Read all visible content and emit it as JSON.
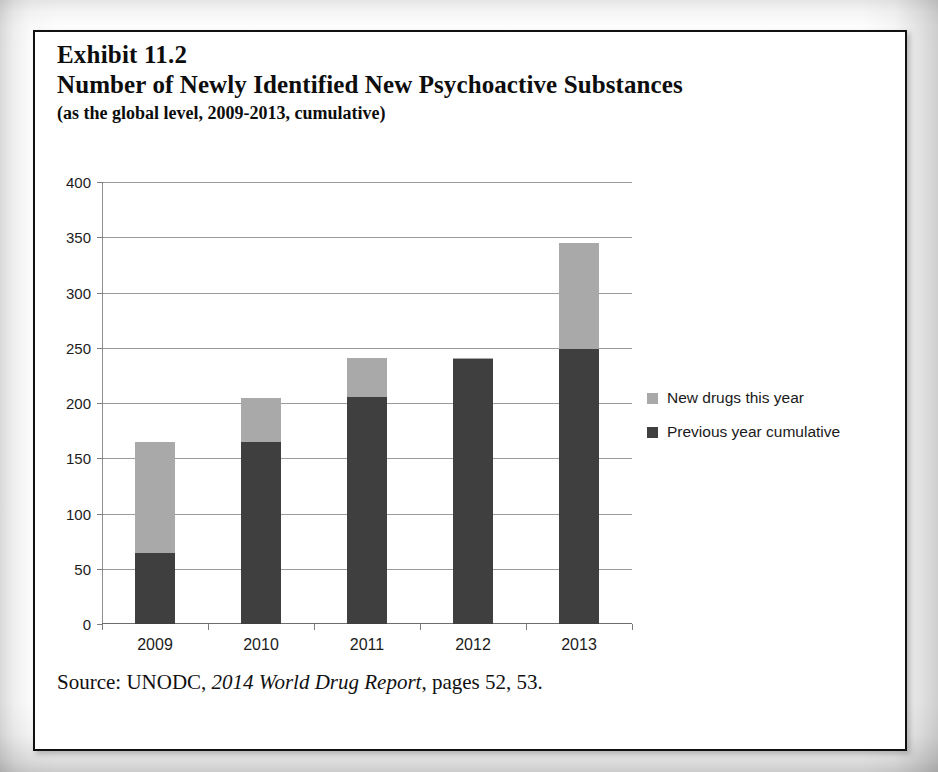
{
  "exhibit": {
    "number_line": "Exhibit 11.2",
    "title": "Number of Newly Identified New Psychoactive Substances",
    "subtitle": "(as the global level, 2009-2013, cumulative)"
  },
  "source": {
    "prefix": "Source: UNODC,",
    "report_title": "2014 World Drug Report",
    "suffix": ", pages 52, 53."
  },
  "legend": {
    "items": [
      {
        "label": "New drugs this year",
        "color": "#a9a9a9",
        "key": "new"
      },
      {
        "label": "Previous year cumulative",
        "color": "#3f3f3f",
        "key": "prev"
      }
    ]
  },
  "colors": {
    "new_drugs": "#a9a9a9",
    "previous_cumulative": "#3f3f3f",
    "gridline": "#9b9b9b",
    "frame": "#111111"
  },
  "axis": {
    "y_ticks": [
      "0",
      "50",
      "100",
      "150",
      "200",
      "250",
      "300",
      "350",
      "400"
    ],
    "x_ticks": [
      "2009",
      "2010",
      "2011",
      "2012",
      "2013"
    ]
  },
  "chart_data": {
    "type": "bar",
    "stacked": true,
    "title": "Number of Newly Identified New Psychoactive Substances",
    "subtitle": "(as the global level, 2009-2013, cumulative)",
    "xlabel": "",
    "ylabel": "",
    "ylim": [
      0,
      400
    ],
    "ytick_step": 50,
    "grid": true,
    "legend_position": "right",
    "categories": [
      "2009",
      "2010",
      "2011",
      "2012",
      "2013"
    ],
    "series": [
      {
        "name": "Previous year cumulative",
        "color": "#3f3f3f",
        "values": [
          64,
          165,
          205,
          240,
          249
        ]
      },
      {
        "name": "New drugs this year",
        "color": "#a9a9a9",
        "values": [
          101,
          40,
          36,
          1,
          96
        ]
      }
    ],
    "totals": [
      165,
      205,
      241,
      241,
      345
    ]
  }
}
